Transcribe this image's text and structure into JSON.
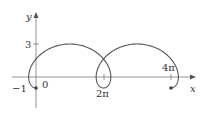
{
  "chart_data": {
    "type": "line",
    "title": "",
    "xlabel": "x",
    "ylabel": "y",
    "x_tick_labels": [
      "0",
      "2π",
      "4π"
    ],
    "y_tick_labels": [
      "3",
      "−1"
    ],
    "series": [
      {
        "name": "trochoid",
        "param": "theta",
        "theta_range": [
          0,
          12.566
        ],
        "r": 1,
        "d": 2,
        "start_point": [
          0,
          -1
        ],
        "end_point": [
          12.566,
          -1
        ]
      }
    ],
    "xlim": [
      -3.3,
      15.5
    ],
    "ylim": [
      -3.3,
      7
    ],
    "grid": false,
    "legend": "none"
  },
  "labels": {
    "x_axis": "x",
    "y_axis": "y",
    "tick_3": "3",
    "tick_neg1": "−1",
    "tick_0": "0",
    "tick_2pi": "2π",
    "tick_4pi": "4π"
  },
  "colors": {
    "curve": "#555555",
    "axes": "#666666",
    "text": "#333333"
  }
}
